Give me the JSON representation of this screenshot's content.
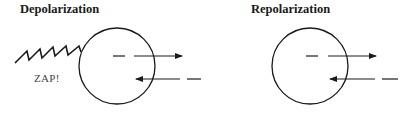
{
  "panels": [
    {
      "title": "Depolarization",
      "stimulus_label": "ZAP!",
      "has_stimulus": true,
      "arrows": [
        {
          "direction": "outward",
          "style": "dashed-then-solid"
        },
        {
          "direction": "inward",
          "style": "solid-then-dashed"
        }
      ]
    },
    {
      "title": "Repolarization",
      "has_stimulus": false,
      "arrows": [
        {
          "direction": "outward",
          "style": "dashed-then-solid"
        },
        {
          "direction": "inward",
          "style": "solid-then-dashed"
        }
      ]
    }
  ],
  "colors": {
    "stroke": "#1a1a1a",
    "label": "#444444",
    "background": "#ffffff"
  }
}
